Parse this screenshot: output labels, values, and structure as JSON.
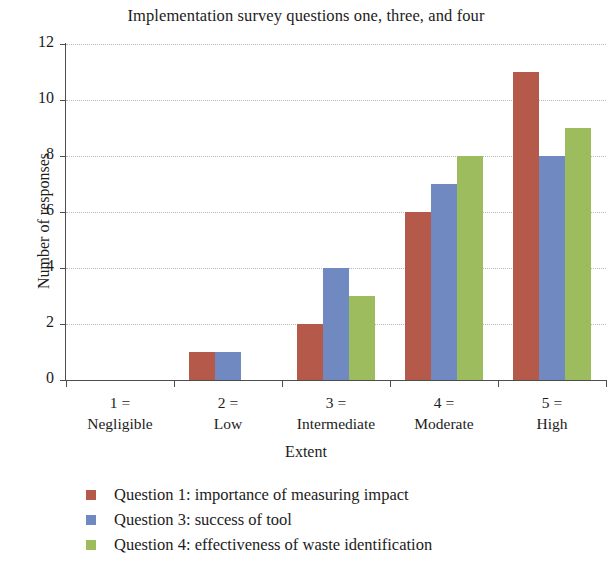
{
  "chart_data": {
    "type": "bar",
    "title": "Implementation survey questions one, three, and four",
    "xlabel": "Extent",
    "ylabel": "Number of responses",
    "categories": [
      "1 =\nNegligible",
      "2 =\nLow",
      "3 =\nIntermediate",
      "4 =\nModerate",
      "5 =\nHigh"
    ],
    "category_parts": [
      {
        "code": "1 =",
        "word": "Negligible"
      },
      {
        "code": "2 =",
        "word": "Low"
      },
      {
        "code": "3 =",
        "word": "Intermediate"
      },
      {
        "code": "4 =",
        "word": "Moderate"
      },
      {
        "code": "5 =",
        "word": "High"
      }
    ],
    "series": [
      {
        "name": "Question 1: importance of measuring impact",
        "color": "#b5594a",
        "values": [
          0,
          1,
          2,
          6,
          11
        ]
      },
      {
        "name": "Question 3: success of tool",
        "color": "#7089c0",
        "values": [
          0,
          1,
          4,
          7,
          8
        ]
      },
      {
        "name": "Question 4: effectiveness of waste identification",
        "color": "#9cbc5e",
        "values": [
          0,
          0,
          3,
          8,
          9
        ]
      }
    ],
    "ylim": [
      0,
      12
    ],
    "yticks": [
      0,
      2,
      4,
      6,
      8,
      10,
      12
    ],
    "ytick_labels": [
      "0",
      "2",
      "4",
      "6",
      "8",
      "10",
      "12"
    ],
    "grid": "horizontal-dotted",
    "legend_position": "bottom-left"
  }
}
